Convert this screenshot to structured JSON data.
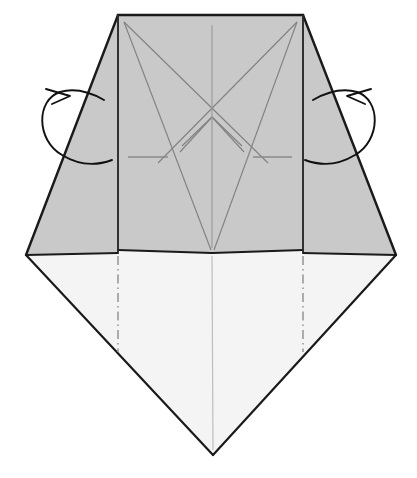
{
  "figure": {
    "title": "Origami folding step diagram",
    "kind": "origami-crease-diagram",
    "width": 417,
    "height": 478,
    "background_color": "#ffffff"
  },
  "palette": {
    "paper_front_gray": "#c9c9c9",
    "paper_back_white": "#f2f2f2",
    "paper_lower_white": "#f4f4f4",
    "outline_dark": "#1a1a1a",
    "crease_line": "#7a7a7a",
    "crease_line_soft": "#8c8c8c",
    "arrow_stroke": "#111111",
    "dash_dot_color": "#9a9a9a"
  },
  "geometry": {
    "top_left_corner": [
      118,
      15
    ],
    "top_right_corner": [
      303,
      15
    ],
    "left_wing_tip": [
      26,
      255
    ],
    "right_wing_tip": [
      396,
      255
    ],
    "center_v_vertex": [
      212,
      253
    ],
    "bottom_point": [
      213,
      455
    ],
    "left_shoulder": [
      118,
      250
    ],
    "right_shoulder": [
      303,
      250
    ],
    "upper_cross_point": [
      212,
      61
    ],
    "lower_cross_point": [
      212,
      117
    ],
    "left_panel_fold_x": 118,
    "right_panel_fold_x": 303,
    "center_axis_x": 212,
    "tick_dash_y": 157
  },
  "shapes": {
    "gray_region_label": "front-facing gray paper area",
    "white_region_label": "lower white kite area",
    "left_wing_label": "left gray wing flap",
    "right_wing_label": "right gray wing flap"
  },
  "creases": {
    "valley_dash_dot_left_label": "left vertical dash-dot crease",
    "valley_dash_dot_right_label": "right vertical dash-dot crease",
    "center_axis_label": "vertical center crease",
    "tick_left_label": "left horizontal reference dash",
    "tick_right_label": "right horizontal reference dash",
    "star_pattern_label": "interior star crease pattern"
  },
  "arrows": {
    "left": {
      "name": "fold-behind-arrow-left",
      "description": "curved arrow looping outward to the left indicating fold behind",
      "direction": "counter-clockwise"
    },
    "right": {
      "name": "fold-behind-arrow-right",
      "description": "curved arrow looping outward to the right indicating fold behind",
      "direction": "clockwise"
    }
  }
}
